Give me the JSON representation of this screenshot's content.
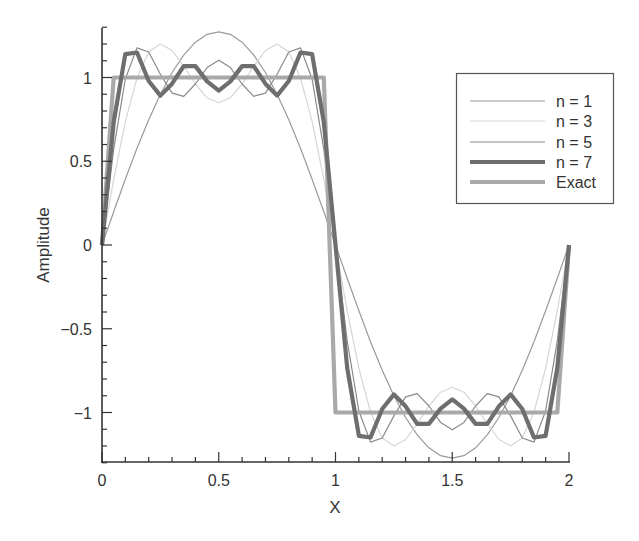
{
  "chart_data": {
    "type": "line",
    "title": "",
    "xlabel": "X",
    "ylabel": "Amplitude",
    "xlim": [
      0,
      2
    ],
    "ylim": [
      -1.3,
      1.3
    ],
    "grid": false,
    "legend_position": "upper right",
    "x_ticks": [
      0,
      0.5,
      1,
      1.5,
      2
    ],
    "x_tick_labels": [
      "0",
      "0.5",
      "1",
      "1.5",
      "2"
    ],
    "y_ticks": [
      -1,
      -0.5,
      0,
      0.5,
      1
    ],
    "y_tick_labels": [
      "−1",
      "−0.5",
      "0",
      "0.5",
      "1"
    ],
    "x": [
      0,
      0.05,
      0.1,
      0.15,
      0.2,
      0.25,
      0.3,
      0.35,
      0.4,
      0.45,
      0.5,
      0.55,
      0.6,
      0.65,
      0.7,
      0.75,
      0.8,
      0.85,
      0.9,
      0.95,
      1.0,
      1.05,
      1.1,
      1.15,
      1.2,
      1.25,
      1.3,
      1.35,
      1.4,
      1.45,
      1.5,
      1.55,
      1.6,
      1.65,
      1.7,
      1.75,
      1.8,
      1.85,
      1.9,
      1.95,
      2.0
    ],
    "series": [
      {
        "name": "n = 1",
        "color": "#9a9a9a",
        "width": 1.2,
        "values": [
          0,
          0.199,
          0.393,
          0.578,
          0.748,
          0.9,
          1.03,
          1.134,
          1.211,
          1.258,
          1.273,
          1.258,
          1.211,
          1.134,
          1.03,
          0.9,
          0.748,
          0.578,
          0.393,
          0.199,
          0,
          -0.199,
          -0.393,
          -0.578,
          -0.748,
          -0.9,
          -1.03,
          -1.134,
          -1.211,
          -1.258,
          -1.273,
          -1.258,
          -1.211,
          -1.134,
          -1.03,
          -0.9,
          -0.748,
          -0.578,
          -0.393,
          -0.199,
          0
        ]
      },
      {
        "name": "n = 3",
        "color": "#d6d6d6",
        "width": 1.2,
        "values": [
          0,
          0.392,
          0.737,
          0.997,
          1.152,
          1.2,
          1.161,
          1.068,
          0.961,
          0.879,
          0.849,
          0.879,
          0.961,
          1.068,
          1.161,
          1.2,
          1.152,
          0.997,
          0.737,
          0.392,
          0,
          -0.392,
          -0.737,
          -0.997,
          -1.152,
          -1.2,
          -1.161,
          -1.068,
          -0.961,
          -0.879,
          -0.849,
          -0.879,
          -0.961,
          -1.068,
          -1.161,
          -1.2,
          -1.152,
          -0.997,
          -0.737,
          -0.392,
          0
        ]
      },
      {
        "name": "n = 5",
        "color": "#8a8a8a",
        "width": 1.2,
        "values": [
          0,
          0.572,
          0.991,
          1.177,
          1.152,
          1.02,
          0.907,
          0.888,
          0.961,
          1.059,
          1.103,
          1.059,
          0.961,
          0.888,
          0.907,
          1.02,
          1.152,
          1.177,
          0.991,
          0.572,
          0,
          -0.572,
          -0.991,
          -1.177,
          -1.152,
          -1.02,
          -0.907,
          -0.888,
          -0.961,
          -1.059,
          -1.103,
          -1.059,
          -0.961,
          -0.888,
          -0.907,
          -1.02,
          -1.152,
          -1.177,
          -0.991,
          -0.572,
          0
        ]
      },
      {
        "name": "n = 7",
        "color": "#6e6e6e",
        "width": 4.2,
        "values": [
          0,
          0.734,
          1.139,
          1.149,
          0.979,
          0.892,
          0.963,
          1.068,
          1.068,
          0.977,
          0.922,
          0.977,
          1.068,
          1.068,
          0.963,
          0.892,
          0.979,
          1.149,
          1.139,
          0.734,
          0,
          -0.734,
          -1.139,
          -1.149,
          -0.979,
          -0.892,
          -0.963,
          -1.068,
          -1.068,
          -0.977,
          -0.922,
          -0.977,
          -1.068,
          -1.068,
          -0.963,
          -0.892,
          -0.979,
          -1.149,
          -1.139,
          -0.734,
          0
        ]
      },
      {
        "name": "Exact",
        "color": "#a9a9a9",
        "width": 4.2,
        "values": [
          0,
          1,
          1,
          1,
          1,
          1,
          1,
          1,
          1,
          1,
          1,
          1,
          1,
          1,
          1,
          1,
          1,
          1,
          1,
          1,
          -1,
          -1,
          -1,
          -1,
          -1,
          -1,
          -1,
          -1,
          -1,
          -1,
          -1,
          -1,
          -1,
          -1,
          -1,
          -1,
          -1,
          -1,
          -1,
          -1,
          0
        ]
      }
    ]
  },
  "legend": {
    "items": [
      {
        "label": "n = 1"
      },
      {
        "label": "n = 3"
      },
      {
        "label": "n = 5"
      },
      {
        "label": "n = 7"
      },
      {
        "label": "Exact"
      }
    ]
  },
  "axes": {
    "xlabel": "X",
    "ylabel": "Amplitude"
  }
}
